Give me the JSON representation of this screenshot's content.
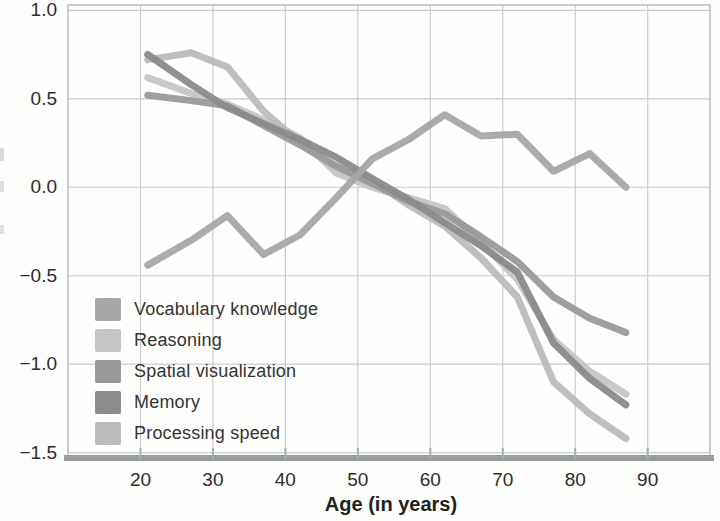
{
  "chart_data": {
    "type": "line",
    "title": "",
    "xlabel": "Age (in years)",
    "ylabel": "",
    "x": [
      21,
      27,
      32,
      37,
      42,
      47,
      52,
      57,
      62,
      67,
      72,
      77,
      82,
      87
    ],
    "xlim": [
      10,
      98.6
    ],
    "ylim": [
      -1.53,
      1.03
    ],
    "xticks": [
      20,
      30,
      40,
      50,
      60,
      70,
      80,
      90
    ],
    "yticks": [
      1.0,
      0.5,
      0.0,
      -0.5,
      -1.0,
      -1.5
    ],
    "ytick_labels": [
      "1.0",
      "0.5",
      "0.0",
      "−0.5",
      "−1.0",
      "−1.5"
    ],
    "grid": true,
    "legend_position": "lower-left",
    "series": [
      {
        "name": "Vocabulary knowledge",
        "color": "#a7a7a7",
        "values": [
          -0.44,
          -0.3,
          -0.16,
          -0.38,
          -0.27,
          -0.06,
          0.16,
          0.27,
          0.41,
          0.29,
          0.3,
          0.09,
          0.19,
          0.0
        ]
      },
      {
        "name": "Reasoning",
        "color": "#c6c6c6",
        "values": [
          0.62,
          0.53,
          0.47,
          0.38,
          0.28,
          0.08,
          0.0,
          -0.06,
          -0.12,
          -0.31,
          -0.52,
          -0.86,
          -1.04,
          -1.17
        ]
      },
      {
        "name": "Spatial visualization",
        "color": "#9a9a9a",
        "values": [
          0.52,
          0.49,
          0.46,
          0.35,
          0.24,
          0.12,
          0.02,
          -0.08,
          -0.15,
          -0.28,
          -0.42,
          -0.62,
          -0.74,
          -0.82
        ]
      },
      {
        "name": "Memory",
        "color": "#8b8b8b",
        "values": [
          0.75,
          0.58,
          0.45,
          0.36,
          0.27,
          0.17,
          0.05,
          -0.07,
          -0.2,
          -0.33,
          -0.48,
          -0.88,
          -1.08,
          -1.23
        ]
      },
      {
        "name": "Processing speed",
        "color": "#bcbcbc",
        "values": [
          0.72,
          0.76,
          0.68,
          0.43,
          0.25,
          0.11,
          0.04,
          -0.1,
          -0.22,
          -0.4,
          -0.62,
          -1.1,
          -1.28,
          -1.42
        ]
      }
    ],
    "style": {
      "plot_bg": "#fefefd",
      "grid_color": "#c9cdcc",
      "box_color": "#bcc0bf",
      "axis_color": "#979d9c",
      "tick_label_color": "#2d2d2d",
      "line_width": 7
    }
  }
}
